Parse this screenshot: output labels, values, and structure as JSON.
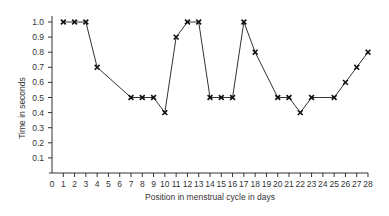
{
  "chart_data": {
    "type": "line",
    "title": "",
    "xlabel": "Position in menstrual cycle in days",
    "ylabel": "Time in seconds",
    "xlim": [
      0,
      28
    ],
    "ylim": [
      0,
      1.0
    ],
    "x_ticks": [
      0,
      1,
      2,
      3,
      4,
      5,
      6,
      7,
      8,
      9,
      10,
      11,
      12,
      13,
      14,
      15,
      16,
      17,
      18,
      19,
      20,
      21,
      22,
      23,
      24,
      25,
      26,
      27,
      28
    ],
    "y_ticks": [
      0.1,
      0.2,
      0.3,
      0.4,
      0.5,
      0.6,
      0.7,
      0.8,
      0.9,
      1.0
    ],
    "grid": false,
    "legend": null,
    "marker": "x",
    "series": [
      {
        "name": "Time in seconds",
        "x": [
          1,
          2,
          3,
          4,
          7,
          8,
          9,
          10,
          11,
          12,
          13,
          14,
          15,
          16,
          17,
          18,
          20,
          21,
          22,
          23,
          25,
          26,
          27,
          28
        ],
        "y": [
          1.0,
          1.0,
          1.0,
          0.7,
          0.5,
          0.5,
          0.5,
          0.4,
          0.9,
          1.0,
          1.0,
          0.5,
          0.5,
          0.5,
          1.0,
          0.8,
          0.5,
          0.5,
          0.4,
          0.5,
          0.5,
          0.6,
          0.7,
          0.8
        ]
      }
    ]
  },
  "colors": {
    "line": "#333333",
    "axis": "#333333",
    "background": "#ffffff"
  }
}
